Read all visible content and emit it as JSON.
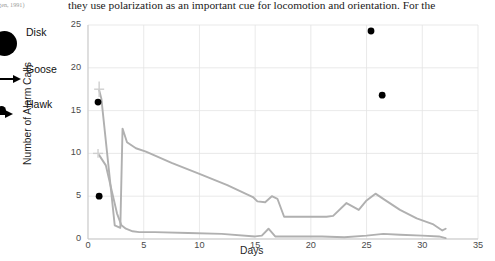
{
  "page_text": {
    "line_main": "they use polarization as an important cue for locomotion and orientation. For the",
    "line_left_fragment": "(gen, 1991)"
  },
  "legend": {
    "items": [
      {
        "label": "Disk",
        "marker": "filled-circle-large"
      },
      {
        "label": "Goose",
        "marker": "arrow-right"
      },
      {
        "label": "Hawk",
        "marker": "arrow-right"
      }
    ]
  },
  "chart_data": {
    "type": "line",
    "title": "",
    "xlabel": "Days",
    "ylabel": "Number of Alarm Calls",
    "xlim": [
      0,
      35
    ],
    "ylim": [
      0,
      25
    ],
    "xticks": [
      0,
      5,
      10,
      15,
      20,
      25,
      30,
      35
    ],
    "yticks": [
      0,
      5,
      10,
      15,
      20,
      25
    ],
    "grid": true,
    "grid_color": "#e3e3e3",
    "line_color": "#b0b0b0",
    "point_color": "#000000",
    "legend_position": "outside-left",
    "series": [
      {
        "name": "trace-a",
        "type": "line",
        "x": [
          1.0,
          1.2,
          2.4,
          2.9,
          3.1,
          3.5,
          4.3,
          5.2,
          7.5,
          10.0,
          12.5,
          14.8,
          15.2,
          15.9,
          16.5,
          17.0,
          17.6,
          18.4,
          20.0,
          21.4,
          22.0,
          23.2,
          24.3,
          25.0,
          25.8,
          26.6,
          28.0,
          29.5,
          31.0,
          31.8,
          32.1
        ],
        "y": [
          17.4,
          16.4,
          1.6,
          1.3,
          12.9,
          11.3,
          10.6,
          10.2,
          8.9,
          7.6,
          6.3,
          4.9,
          4.4,
          4.3,
          5.0,
          4.7,
          2.6,
          2.6,
          2.6,
          2.6,
          2.7,
          4.2,
          3.4,
          4.5,
          5.3,
          4.6,
          3.4,
          2.4,
          1.7,
          1.0,
          1.2
        ]
      },
      {
        "name": "trace-b",
        "type": "line",
        "x": [
          1.0,
          1.6,
          2.6,
          3.0,
          3.4,
          4.0,
          4.6,
          6.0,
          9.0,
          12.0,
          15.0,
          15.6,
          16.2,
          16.8,
          17.6,
          19.0,
          21.0,
          23.0,
          25.0,
          26.5,
          28.0,
          30.0,
          31.5,
          32.1
        ],
        "y": [
          9.8,
          8.6,
          3.0,
          1.6,
          1.2,
          0.9,
          0.8,
          0.8,
          0.7,
          0.6,
          0.3,
          0.4,
          1.2,
          0.3,
          0.3,
          0.3,
          0.3,
          0.2,
          0.4,
          0.6,
          0.5,
          0.4,
          0.3,
          0.1
        ]
      }
    ],
    "points": [
      {
        "name": "disk-point-1",
        "x": 0.9,
        "y": 16.0
      },
      {
        "name": "disk-point-2",
        "x": 1.0,
        "y": 5.0
      },
      {
        "name": "disk-point-3",
        "x": 25.4,
        "y": 24.3
      },
      {
        "name": "disk-point-4",
        "x": 26.4,
        "y": 16.8
      }
    ],
    "error_bars": [
      {
        "name": "errorbar-upper",
        "x": 1.0,
        "y": 17.5,
        "yerr": 0.9,
        "xerr": 0.45
      },
      {
        "name": "errorbar-lower",
        "x": 0.9,
        "y": 10.0,
        "yerr": 0.5,
        "xerr": 0.45
      }
    ]
  }
}
